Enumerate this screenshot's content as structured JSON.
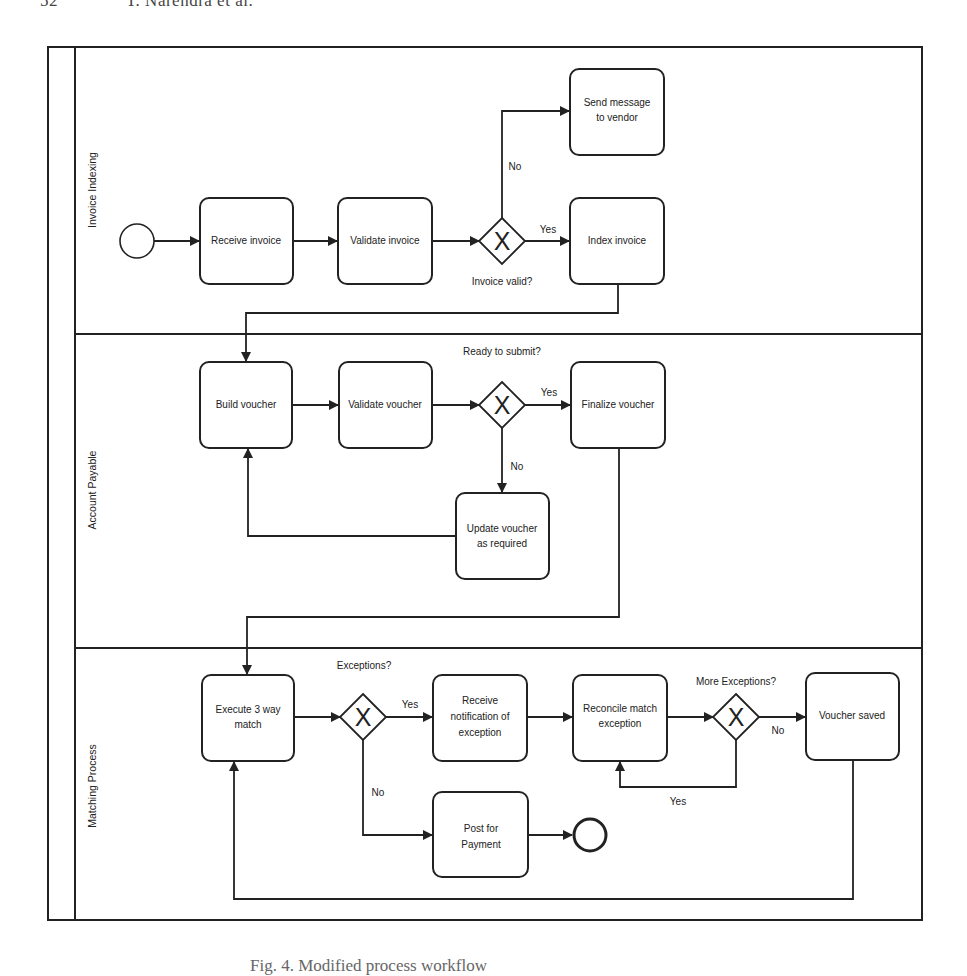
{
  "page": {
    "page_number": "52",
    "authors": "T. Narendra et al.",
    "caption": "Fig. 4. Modified process workflow"
  },
  "lanes": [
    {
      "label": "Invoice Indexing"
    },
    {
      "label": "Account Payable"
    },
    {
      "label": "Matching Process"
    }
  ],
  "tasks": {
    "receive_invoice": "Receive invoice",
    "validate_invoice": "Validate invoice",
    "send_message_l1": "Send message",
    "send_message_l2": "to vendor",
    "index_invoice": "Index invoice",
    "build_voucher": "Build voucher",
    "validate_voucher": "Validate voucher",
    "finalize_voucher": "Finalize voucher",
    "update_voucher_l1": "Update voucher",
    "update_voucher_l2": "as required",
    "execute_match_l1": "Execute 3 way",
    "execute_match_l2": "match",
    "receive_notif_l1": "Receive",
    "receive_notif_l2": "notification of",
    "receive_notif_l3": "exception",
    "reconcile_l1": "Reconcile match",
    "reconcile_l2": "exception",
    "voucher_saved": "Voucher saved",
    "post_payment_l1": "Post for",
    "post_payment_l2": "Payment"
  },
  "gateways": {
    "invoice_valid": {
      "question": "Invoice valid?",
      "yes": "Yes",
      "no": "No",
      "symbol": "X"
    },
    "ready_submit": {
      "question": "Ready to submit?",
      "yes": "Yes",
      "no": "No",
      "symbol": "X"
    },
    "exceptions": {
      "question": "Exceptions?",
      "yes": "Yes",
      "no": "No",
      "symbol": "X"
    },
    "more_exceptions": {
      "question": "More Exceptions?",
      "yes": "Yes",
      "no": "No",
      "symbol": "X"
    }
  }
}
